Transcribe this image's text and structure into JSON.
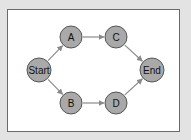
{
  "diagram": {
    "type": "directed-graph",
    "colors": {
      "background": "#e3e3e3",
      "frame_fill": "#ffffff",
      "frame_border": "#6a6a6a",
      "node_fill": "#a9a9a9",
      "node_stroke": "#555555",
      "edge": "#8a8a8a"
    },
    "nodes": [
      {
        "id": "start",
        "label": "Start",
        "cx": 39,
        "cy": 70,
        "r": 12
      },
      {
        "id": "a",
        "label": "A",
        "cx": 71,
        "cy": 37,
        "r": 11
      },
      {
        "id": "c",
        "label": "C",
        "cx": 116,
        "cy": 37,
        "r": 11
      },
      {
        "id": "end",
        "label": "End",
        "cx": 152,
        "cy": 70,
        "r": 12
      },
      {
        "id": "b",
        "label": "B",
        "cx": 71,
        "cy": 103,
        "r": 11
      },
      {
        "id": "d",
        "label": "D",
        "cx": 116,
        "cy": 103,
        "r": 11
      }
    ],
    "edges": [
      {
        "from": "start",
        "to": "a"
      },
      {
        "from": "a",
        "to": "c"
      },
      {
        "from": "c",
        "to": "end"
      },
      {
        "from": "start",
        "to": "b"
      },
      {
        "from": "b",
        "to": "d"
      },
      {
        "from": "d",
        "to": "end"
      }
    ]
  }
}
